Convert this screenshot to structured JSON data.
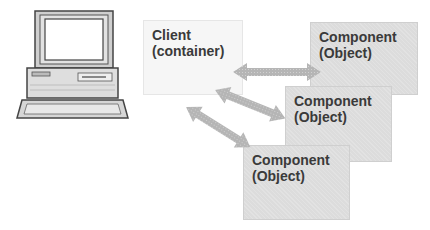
{
  "diagram": {
    "computer": {
      "icon": "desktop-computer-icon"
    },
    "client": {
      "line1": "Client",
      "line2": "(container)"
    },
    "components": [
      {
        "line1": "Component",
        "line2": "(Object)"
      },
      {
        "line1": "Component",
        "line2": "(Object)"
      },
      {
        "line1": "Component",
        "line2": "(Object)"
      }
    ],
    "arrows": [
      {
        "from": "client",
        "to": "component-1",
        "type": "bidirectional"
      },
      {
        "from": "client",
        "to": "component-2",
        "type": "bidirectional"
      },
      {
        "from": "client",
        "to": "component-3",
        "type": "bidirectional"
      }
    ],
    "colors": {
      "client_bg": "#f6f6f6",
      "component_bg": "#dcdcdc",
      "arrow": "#b5b5b5",
      "text": "#3a3a3a"
    }
  }
}
